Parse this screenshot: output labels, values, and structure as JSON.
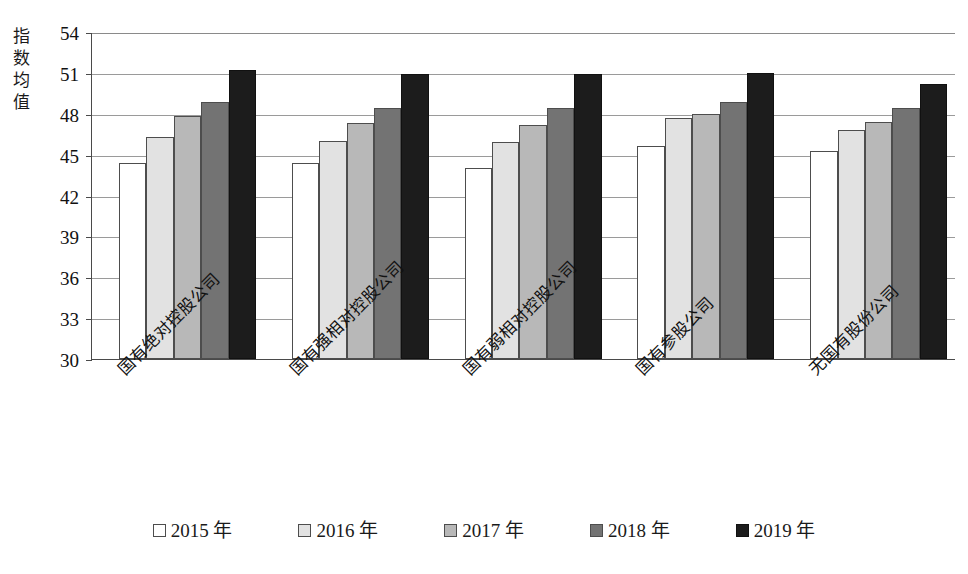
{
  "chart_data": {
    "type": "bar",
    "title": "",
    "xlabel": "",
    "ylabel": "指数均值",
    "ylim": [
      30,
      54
    ],
    "ytick_step": 3,
    "yticks": [
      54,
      51,
      48,
      45,
      42,
      39,
      36,
      33,
      30
    ],
    "grid": true,
    "legend_position": "bottom",
    "categories": [
      "国有绝对控股公司",
      "国有强相对控股公司",
      "国有弱相对控股公司",
      "国有参股公司",
      "无国有股份公司"
    ],
    "series": [
      {
        "name": "2015 年",
        "color": "#ffffff",
        "values": [
          44.4,
          44.4,
          44.0,
          45.6,
          45.3
        ]
      },
      {
        "name": "2016 年",
        "color": "#e2e2e2",
        "values": [
          46.3,
          46.0,
          45.9,
          47.7,
          46.8
        ]
      },
      {
        "name": "2017 年",
        "color": "#b8b8b8",
        "values": [
          47.8,
          47.3,
          47.2,
          48.0,
          47.4
        ]
      },
      {
        "name": "2018 年",
        "color": "#737373",
        "values": [
          48.9,
          48.4,
          48.4,
          48.9,
          48.4
        ]
      },
      {
        "name": "2019 年",
        "color": "#1c1c1c",
        "values": [
          51.2,
          50.9,
          50.9,
          51.0,
          50.2
        ]
      }
    ]
  },
  "axis": {
    "y_title": "指数均值",
    "y_title_chars": [
      "指",
      "数",
      "均",
      "值"
    ]
  },
  "legend": {
    "items": [
      "2015 年",
      "2016 年",
      "2017 年",
      "2018 年",
      "2019 年"
    ]
  }
}
